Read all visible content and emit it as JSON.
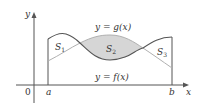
{
  "diagram": {
    "axes": {
      "y_label": "y",
      "x_label": "x",
      "origin_label": "0"
    },
    "bounds": {
      "a_label": "a",
      "b_label": "b"
    },
    "curves": {
      "g_label": "y = g(x)",
      "f_label": "y = f(x)"
    },
    "regions": {
      "s1": {
        "letter": "S",
        "sub": "1"
      },
      "s2": {
        "letter": "S",
        "sub": "2"
      },
      "s3": {
        "letter": "S",
        "sub": "3"
      }
    },
    "colors": {
      "axis": "#555555",
      "f_curve": "#555555",
      "g_curve": "#b0b0b0",
      "shaded": "#d6d6d6"
    }
  }
}
